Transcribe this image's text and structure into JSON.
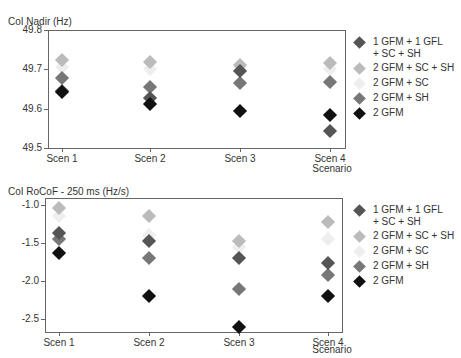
{
  "chart_data": [
    {
      "type": "scatter",
      "title": "CoI Nadir (Hz)",
      "xlabel": "Scenario",
      "ylabel": "",
      "categories": [
        "Scen 1",
        "Scen 2",
        "Scen 3",
        "Scen 4"
      ],
      "ylim": [
        49.5,
        49.8
      ],
      "yticks": [
        "49.8",
        "49.7",
        "49.6",
        "49.5"
      ],
      "grid": false,
      "legend_position": "right",
      "series": [
        {
          "name": "1 GFM + 1 GFL + SC + SH",
          "color": "#555555",
          "values": [
            49.645,
            49.628,
            49.697,
            49.543
          ]
        },
        {
          "name": "2 GFM + SC + SH",
          "color": "#bbbbbb",
          "values": [
            49.725,
            49.718,
            49.71,
            49.717
          ]
        },
        {
          "name": "2 GFM + SC",
          "color": "#eeeeee",
          "values": [
            49.705,
            49.702,
            49.705,
            49.7
          ]
        },
        {
          "name": "2 GFM + SH",
          "color": "#777777",
          "values": [
            49.677,
            49.655,
            49.665,
            49.668
          ]
        },
        {
          "name": "2 GFM",
          "color": "#111111",
          "values": [
            49.643,
            49.612,
            49.593,
            49.585
          ]
        }
      ]
    },
    {
      "type": "scatter",
      "title": "CoI RoCoF - 250 ms (Hz/s)",
      "xlabel": "Scenario",
      "ylabel": "",
      "categories": [
        "Scen 1",
        "Scen 2",
        "Scen 3",
        "Scen 4"
      ],
      "ylim": [
        -2.7,
        -0.95
      ],
      "yticks": [
        "-1.0",
        "-1.5",
        "-2.0",
        "-2.5"
      ],
      "grid": false,
      "legend_position": "right",
      "series": [
        {
          "name": "1 GFM + 1 GFL + SC + SH",
          "color": "#555555",
          "values": [
            -1.37,
            -1.48,
            -1.7,
            -1.76
          ]
        },
        {
          "name": "2 GFM + SC + SH",
          "color": "#bbbbbb",
          "values": [
            -1.04,
            -1.14,
            -1.48,
            -1.23
          ]
        },
        {
          "name": "2 GFM + SC",
          "color": "#eeeeee",
          "values": [
            -1.15,
            -1.4,
            -1.55,
            -1.45
          ]
        },
        {
          "name": "2 GFM + SH",
          "color": "#777777",
          "values": [
            -1.45,
            -1.7,
            -2.1,
            -1.92
          ]
        },
        {
          "name": "2 GFM",
          "color": "#111111",
          "values": [
            -1.63,
            -2.2,
            -2.6,
            -2.2
          ]
        }
      ]
    }
  ],
  "top": {
    "title": "CoI Nadir (Hz)",
    "xlabel": "Scenario"
  },
  "bottom": {
    "title": "CoI RoCoF - 250 ms (Hz/s)",
    "xlabel": "Scenario"
  },
  "legend": [
    {
      "line1": "1 GFM + 1 GFL",
      "line2": "+ SC + SH",
      "color": "#555555"
    },
    {
      "line1": "2 GFM + SC + SH",
      "line2": "",
      "color": "#bbbbbb"
    },
    {
      "line1": "2 GFM + SC",
      "line2": "",
      "color": "#eeeeee"
    },
    {
      "line1": "2 GFM + SH",
      "line2": "",
      "color": "#777777"
    },
    {
      "line1": "2 GFM",
      "line2": "",
      "color": "#111111"
    }
  ]
}
